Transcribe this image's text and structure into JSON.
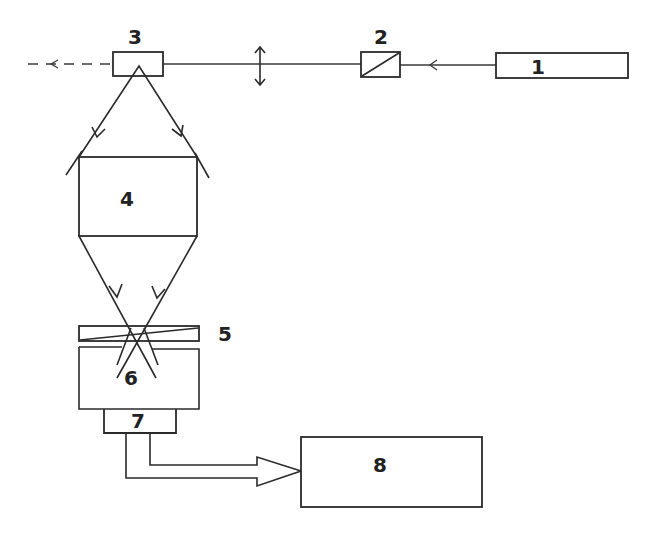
{
  "diagram": {
    "type": "optical schematic",
    "background": "#ffffff",
    "stroke_color": "#2a2a2a",
    "components": [
      {
        "id": "1",
        "label": "1",
        "desc": "source block (right)"
      },
      {
        "id": "2",
        "label": "2",
        "desc": "small box with diagonal (beam element)"
      },
      {
        "id": "3",
        "label": "3",
        "desc": "beam splitter box"
      },
      {
        "id": "4",
        "label": "4",
        "desc": "central block between mirrors"
      },
      {
        "id": "5",
        "label": "5",
        "desc": "thin wedge element"
      },
      {
        "id": "6",
        "label": "6",
        "desc": "lower block"
      },
      {
        "id": "7",
        "label": "7",
        "desc": "detector block"
      },
      {
        "id": "8",
        "label": "8",
        "desc": "output/processing block"
      }
    ],
    "arrows": [
      {
        "from": "1",
        "to": "2",
        "style": "solid"
      },
      {
        "from": "3",
        "to": "left-exit",
        "style": "dashed"
      },
      {
        "from": "3",
        "to": "4",
        "style": "solid",
        "note": "two diverging beams"
      },
      {
        "from": "4",
        "to": "5",
        "style": "solid",
        "note": "two converging beams crossing"
      },
      {
        "from": "7",
        "to": "8",
        "style": "double-line hollow arrow"
      }
    ],
    "lens_symbol": "double-headed vertical arrow on beam path"
  }
}
